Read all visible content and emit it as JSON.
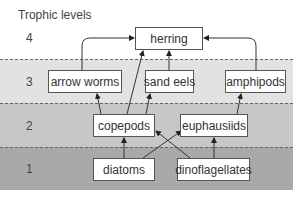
{
  "title": "Trophic levels",
  "levels": [
    {
      "number": "4"
    },
    {
      "number": "3"
    },
    {
      "number": "2"
    },
    {
      "number": "1"
    }
  ],
  "nodes": {
    "herring": "herring",
    "arrow_worms": "arrow worms",
    "sand_eels": "sand eels",
    "amphipods": "amphipods",
    "copepods": "copepods",
    "euphausiids": "euphausiids",
    "diatoms": "diatoms",
    "dinoflagellates": "dinoflagellates"
  },
  "edges": [
    {
      "from": "diatoms",
      "to": "copepods"
    },
    {
      "from": "diatoms",
      "to": "euphausiids"
    },
    {
      "from": "dinoflagellates",
      "to": "copepods"
    },
    {
      "from": "dinoflagellates",
      "to": "euphausiids"
    },
    {
      "from": "copepods",
      "to": "arrow worms"
    },
    {
      "from": "copepods",
      "to": "sand eels"
    },
    {
      "from": "copepods",
      "to": "herring"
    },
    {
      "from": "euphausiids",
      "to": "amphipods"
    },
    {
      "from": "arrow worms",
      "to": "herring"
    },
    {
      "from": "sand eels",
      "to": "herring"
    },
    {
      "from": "amphipods",
      "to": "herring"
    }
  ],
  "colors": {
    "level3": "#e2e2e2",
    "level2": "#c7c7c7",
    "level1": "#a9a9a9"
  }
}
